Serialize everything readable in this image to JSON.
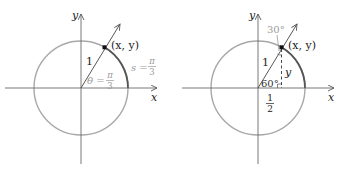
{
  "figures": [
    {
      "id": "left",
      "axes": {
        "x_label": "x",
        "y_label": "y"
      },
      "point_label": "(x, y)",
      "radius_label": "1",
      "angle_label": {
        "lhs": "θ =",
        "num": "π",
        "den": "3"
      },
      "arc_label": {
        "lhs": "s =",
        "num": "π",
        "den": "3"
      }
    },
    {
      "id": "right",
      "axes": {
        "x_label": "x",
        "y_label": "y"
      },
      "point_label": "(x, y)",
      "radius_label": "1",
      "top_angle_label": "30°",
      "bottom_angle_label": "60°",
      "height_label": "y",
      "base_label": {
        "num": "1",
        "den": "2"
      }
    }
  ],
  "colors": {
    "axis": "#6a6a6a",
    "circle": "#a8a8a8",
    "arc_highlight": "#555555",
    "ray": "#444444",
    "text": "#222222",
    "annotation_gray": "#9a9a9a",
    "point": "#111111"
  }
}
